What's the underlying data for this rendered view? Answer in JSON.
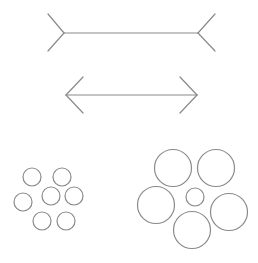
{
  "stroke_color": "#8a8a8a",
  "background": "#ffffff",
  "muller_lyer": {
    "top_line": {
      "label": "Müller-Lyer line with outward fins",
      "shaft": [
        64,
        33,
        198,
        33
      ],
      "fins": [
        [
          64,
          33,
          48,
          14
        ],
        [
          64,
          33,
          48,
          51
        ],
        [
          198,
          33,
          215,
          14
        ],
        [
          198,
          33,
          215,
          51
        ]
      ]
    },
    "bottom_line": {
      "label": "Müller-Lyer line with inward arrowheads",
      "shaft": [
        66,
        95,
        197,
        95
      ],
      "fins": [
        [
          66,
          95,
          83,
          77
        ],
        [
          66,
          95,
          83,
          113
        ],
        [
          197,
          95,
          180,
          77
        ],
        [
          197,
          95,
          180,
          113
        ]
      ]
    }
  },
  "ebbinghaus": {
    "left_group": {
      "label": "Center circle surrounded by small circles",
      "center": {
        "cx": 51,
        "cy": 196,
        "r": 9
      },
      "surround": [
        {
          "cx": 32,
          "cy": 177,
          "r": 9
        },
        {
          "cx": 62,
          "cy": 177,
          "r": 9
        },
        {
          "cx": 23,
          "cy": 202,
          "r": 9
        },
        {
          "cx": 74,
          "cy": 196,
          "r": 9
        },
        {
          "cx": 42,
          "cy": 221,
          "r": 9
        },
        {
          "cx": 66,
          "cy": 221,
          "r": 9
        }
      ]
    },
    "right_group": {
      "label": "Center circle surrounded by large circles",
      "center": {
        "cx": 195,
        "cy": 197,
        "r": 9
      },
      "surround": [
        {
          "cx": 173,
          "cy": 168,
          "r": 18.5
        },
        {
          "cx": 216,
          "cy": 168,
          "r": 18.5
        },
        {
          "cx": 156,
          "cy": 205,
          "r": 18.5
        },
        {
          "cx": 229,
          "cy": 212,
          "r": 18.5
        },
        {
          "cx": 192,
          "cy": 230,
          "r": 18.5
        }
      ]
    }
  }
}
